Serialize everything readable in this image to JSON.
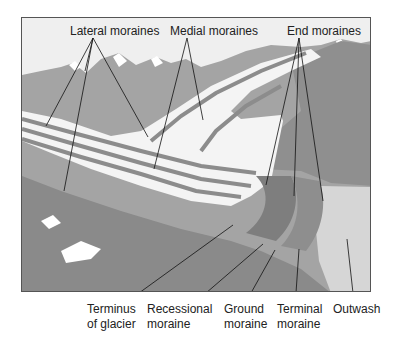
{
  "diagram": {
    "type": "glacier landforms illustration",
    "top_labels": {
      "lateral": "Lateral moraines",
      "medial": "Medial moraines",
      "end": "End moraines"
    },
    "bottom_labels": {
      "terminus_l1": "Terminus",
      "terminus_l2": "of glacier",
      "recessional_l1": "Recessional",
      "recessional_l2": "moraine",
      "ground_l1": "Ground",
      "ground_l2": "moraine",
      "terminal_l1": "Terminal",
      "terminal_l2": "moraine",
      "outwash": "Outwash"
    },
    "colors": {
      "sky": "#efefef",
      "mountain": "#9a9a9a",
      "mountain_dark": "#7e7e7e",
      "ice": "#f4f4f4",
      "moraine_band": "#8c8c8c",
      "outwash": "#d4d4d4",
      "leader_line": "#111111"
    }
  }
}
